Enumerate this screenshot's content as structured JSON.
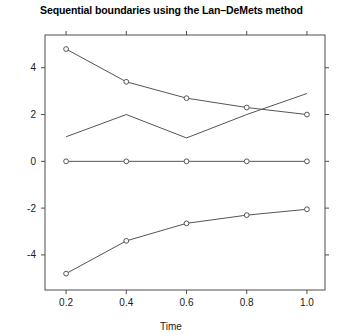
{
  "chart_data": {
    "type": "line",
    "title": "Sequential boundaries using the Lan–DeMets method",
    "xlabel": "Time",
    "ylabel": "",
    "x": [
      0.2,
      0.4,
      0.6,
      0.8,
      1.0
    ],
    "xlim": [
      0.13,
      1.06
    ],
    "ylim": [
      -5.5,
      5.4
    ],
    "xticks": [
      0.2,
      0.4,
      0.6,
      0.8,
      1.0
    ],
    "xticklabels": [
      "0.2",
      "0.4",
      "0.6",
      "0.8",
      "1.0"
    ],
    "yticks": [
      -4,
      -2,
      0,
      2,
      4
    ],
    "yticklabels": [
      "-4",
      "-2",
      "0",
      "2",
      "4"
    ],
    "grid": false,
    "legend": false,
    "box": true,
    "series": [
      {
        "name": "upper-boundary",
        "values": [
          4.8,
          3.4,
          2.7,
          2.3,
          2.0
        ],
        "markers": true,
        "color": "#555555"
      },
      {
        "name": "middle-line",
        "values": [
          1.05,
          2.0,
          1.0,
          2.0,
          2.9
        ],
        "markers": false,
        "color": "#555555"
      },
      {
        "name": "zero-line",
        "values": [
          0,
          0,
          0,
          0,
          0
        ],
        "markers": true,
        "color": "#555555"
      },
      {
        "name": "lower-boundary",
        "values": [
          -4.8,
          -3.4,
          -2.65,
          -2.3,
          -2.05
        ],
        "markers": true,
        "color": "#555555"
      }
    ]
  },
  "colors": {
    "axis": "#4d4d4d",
    "line": "#555555",
    "marker_stroke": "#555555",
    "marker_fill": "#ffffff",
    "text": "#1a1a1a",
    "background": "#ffffff"
  }
}
